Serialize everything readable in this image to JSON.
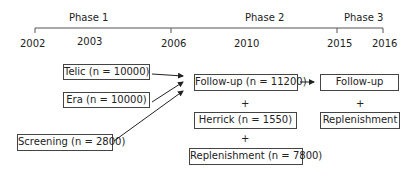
{
  "timeline": {
    "phases": [
      {
        "label": "Phase 1"
      },
      {
        "label": "Phase 2"
      },
      {
        "label": "Phase 3"
      }
    ],
    "years": [
      "2002",
      "2003",
      "2006",
      "2010",
      "2015",
      "2016"
    ]
  },
  "boxes": {
    "telic": "Telic (n = 10000)",
    "era": "Era (n = 10000)",
    "screening": "Screening (n = 2800)",
    "followup_phase2": "Follow-up (n = 11200)",
    "herrick": "Herrick (n = 1550)",
    "replenishment_phase2": "Replenishment (n = 7800)",
    "followup_phase3": "Follow-up",
    "replenishment_phase3": "Replenishment"
  },
  "plus_symbol": "+"
}
